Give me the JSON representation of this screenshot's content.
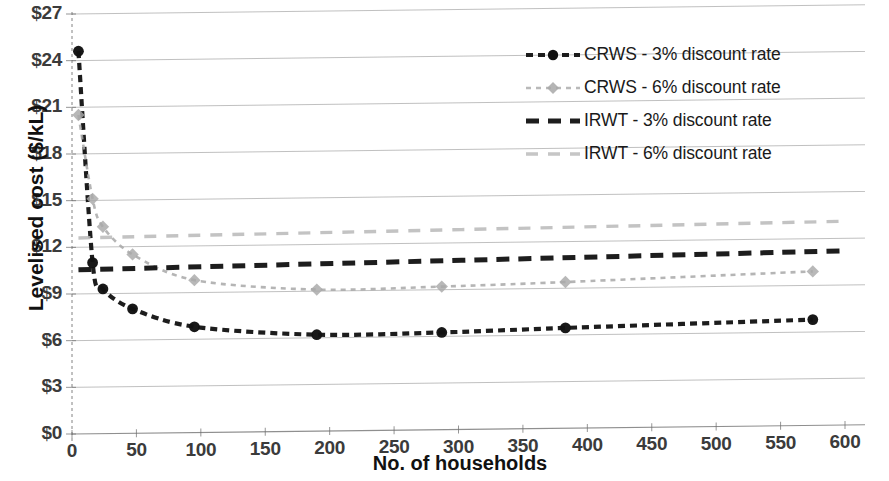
{
  "chart_data": {
    "type": "line",
    "title": "",
    "xlabel": "No. of households",
    "ylabel": "Levelised cost ($/kL)",
    "xlim": [
      0,
      600
    ],
    "ylim": [
      0,
      27
    ],
    "xticks": [
      0,
      50,
      100,
      150,
      200,
      250,
      300,
      350,
      400,
      450,
      500,
      550,
      600
    ],
    "xtick_labels": [
      "0",
      "50",
      "100",
      "150",
      "200",
      "250",
      "300",
      "350",
      "400",
      "450",
      "500",
      "550",
      "600"
    ],
    "yticks": [
      0,
      3,
      6,
      9,
      12,
      15,
      18,
      21,
      24,
      27
    ],
    "ytick_labels": [
      "$0",
      "$3",
      "$6",
      "$9",
      "$12",
      "$15",
      "$18",
      "$21",
      "$24",
      "$27"
    ],
    "grid": "horizontal",
    "legend_position": "upper right",
    "series": [
      {
        "name": "CRWS - 3% discount rate",
        "color": "#111111",
        "style": "dashed",
        "marker": "circle",
        "x": [
          5,
          16,
          24,
          47,
          95,
          190,
          287,
          383,
          575
        ],
        "values": [
          24.6,
          11.0,
          9.3,
          8.0,
          6.8,
          6.2,
          6.25,
          6.45,
          6.8
        ]
      },
      {
        "name": "CRWS - 6% discount rate",
        "color": "#a8a8a8",
        "style": "dashed",
        "marker": "diamond",
        "x": [
          5,
          16,
          24,
          47,
          95,
          190,
          287,
          383,
          575
        ],
        "values": [
          20.5,
          15.1,
          13.3,
          11.5,
          9.8,
          9.1,
          9.2,
          9.4,
          9.9
        ]
      },
      {
        "name": "IRWT - 3% discount rate",
        "color": "#111111",
        "style": "long-dashed",
        "marker": "none",
        "x": [
          5,
          600
        ],
        "values": [
          10.55,
          11.2
        ]
      },
      {
        "name": "IRWT - 6% discount rate",
        "color": "#b8b8b8",
        "style": "long-dashed",
        "marker": "none",
        "x": [
          5,
          600
        ],
        "values": [
          12.6,
          13.1
        ]
      }
    ]
  },
  "axes": {
    "y_title": "Levelised cost ($/kL)",
    "x_title": "No. of households"
  },
  "legend": {
    "entries": [
      {
        "label": "CRWS - 3% discount rate",
        "color": "#111111",
        "marker": "circle",
        "style": "dashed"
      },
      {
        "label": "CRWS - 6% discount rate",
        "color": "#a8a8a8",
        "marker": "diamond",
        "style": "dashed"
      },
      {
        "label": "IRWT - 3% discount rate",
        "color": "#111111",
        "marker": "none",
        "style": "long-dashed"
      },
      {
        "label": "IRWT - 6% discount rate",
        "color": "#b8b8b8",
        "marker": "none",
        "style": "long-dashed"
      }
    ]
  },
  "colors": {
    "series_black": "#111111",
    "series_gray": "#a8a8a8",
    "gridline": "#9a9a9a",
    "axis": "#6e6e6e",
    "text": "#1a1a1a"
  }
}
